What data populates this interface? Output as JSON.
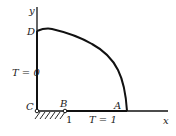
{
  "diagram": {
    "axes": {
      "x_label": "x",
      "y_label": "y"
    },
    "points": {
      "A": "A",
      "B": "B",
      "C": "C",
      "D": "D"
    },
    "boundary_conditions": {
      "left": "T = 0",
      "bottom": "T = 1"
    },
    "tick_label": "1",
    "colors": {
      "line": "#111111",
      "background": "#ffffff"
    }
  }
}
